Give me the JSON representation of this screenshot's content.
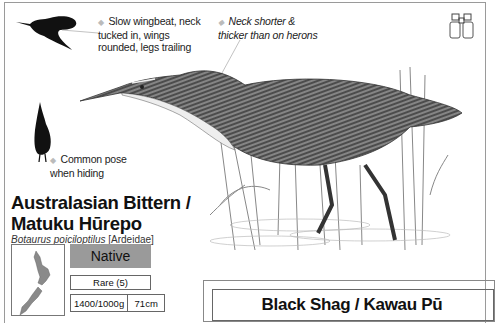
{
  "species": {
    "common_name_line1": "Australasian Bittern /",
    "common_name_line2": "Matuku Hūrepo",
    "scientific_name": "Botaurus poiciloptilus",
    "family": "[Ardeidae]",
    "status": "Native",
    "rarity": "Rare (5)",
    "weight": "1400/1000g",
    "length": "71cm"
  },
  "annotations": {
    "flight_note_line1": "Slow wingbeat, neck",
    "flight_note_line2": "tucked in, wings",
    "flight_note_line3": "rounded, legs trailing",
    "neck_note_line1": "Neck shorter &",
    "neck_note_line2": "thicker than on herons",
    "pose_note_line1": "Common pose",
    "pose_note_line2": "when hiding",
    "bullet": "◆"
  },
  "icons": {
    "binoculars": "binoculars-icon",
    "nz_map": "new-zealand-map"
  },
  "next_entry": {
    "title": "Black Shag / Kawau Pū"
  },
  "colors": {
    "status_fill": "#9a9a9a",
    "map_fill": "#8a8a8a",
    "border": "#777777"
  }
}
